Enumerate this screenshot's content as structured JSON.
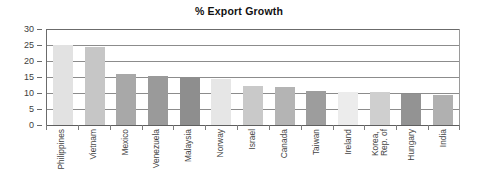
{
  "chart": {
    "title": "% Export Growth"
  },
  "chart_data": {
    "type": "bar",
    "title": "% Export Growth",
    "xlabel": "",
    "ylabel": "",
    "ylim": [
      0,
      30
    ],
    "yticks": [
      0,
      5,
      10,
      15,
      20,
      25,
      30
    ],
    "ytick_labels": [
      "0",
      "5",
      "10",
      "15",
      "20",
      "25",
      "30"
    ],
    "grid": true,
    "legend": "none",
    "categories": [
      "Philippines",
      "Vietnam",
      "Mexico",
      "Venezuela",
      "Malaysia",
      "Norway",
      "Israel",
      "Canada",
      "Taiwan",
      "Ireland",
      "Korea, Rep. of",
      "Hungary",
      "India"
    ],
    "category_lines": [
      [
        "Philippines"
      ],
      [
        "Vietnam"
      ],
      [
        "Mexico"
      ],
      [
        "Venezuela"
      ],
      [
        "Malaysia"
      ],
      [
        "Norway"
      ],
      [
        "Israel"
      ],
      [
        "Canada"
      ],
      [
        "Taiwan"
      ],
      [
        "Ireland"
      ],
      [
        "Korea,",
        "Rep. of"
      ],
      [
        "Hungary"
      ],
      [
        "India"
      ]
    ],
    "values": [
      25.0,
      24.5,
      16.0,
      15.3,
      15.0,
      14.3,
      12.2,
      12.0,
      10.5,
      10.3,
      10.2,
      9.8,
      9.5
    ],
    "bar_colors": [
      "#e2e2e2",
      "#c6c6c6",
      "#a8a8a8",
      "#9a9a9a",
      "#8e8e8e",
      "#e6e6e6",
      "#c9c9c9",
      "#b4b4b4",
      "#9d9d9d",
      "#ececec",
      "#cfcfcf",
      "#939393",
      "#b0b0b0"
    ],
    "axis_color": "#6b6b6b",
    "gridline_color": "#8c8c8c",
    "title_color": "#111111"
  }
}
